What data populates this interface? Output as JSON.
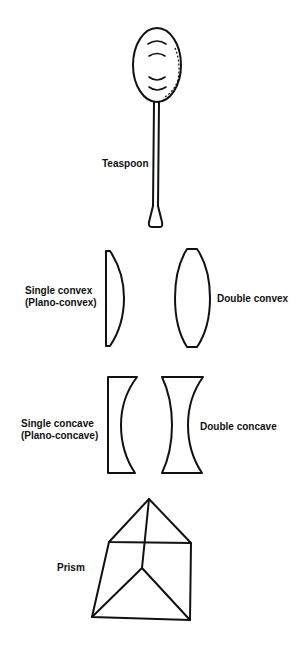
{
  "diagram": {
    "items": [
      {
        "id": "teaspoon",
        "label": "Teaspoon"
      },
      {
        "id": "plano-convex",
        "label_line1": "Single convex",
        "label_line2": "(Plano-convex)"
      },
      {
        "id": "double-convex",
        "label": "Double convex"
      },
      {
        "id": "plano-concave",
        "label_line1": "Single concave",
        "label_line2": "(Plano-concave)"
      },
      {
        "id": "double-concave",
        "label": "Double concave"
      },
      {
        "id": "prism",
        "label": "Prism"
      }
    ],
    "colors": {
      "line": "#111111",
      "background": "#ffffff"
    }
  }
}
